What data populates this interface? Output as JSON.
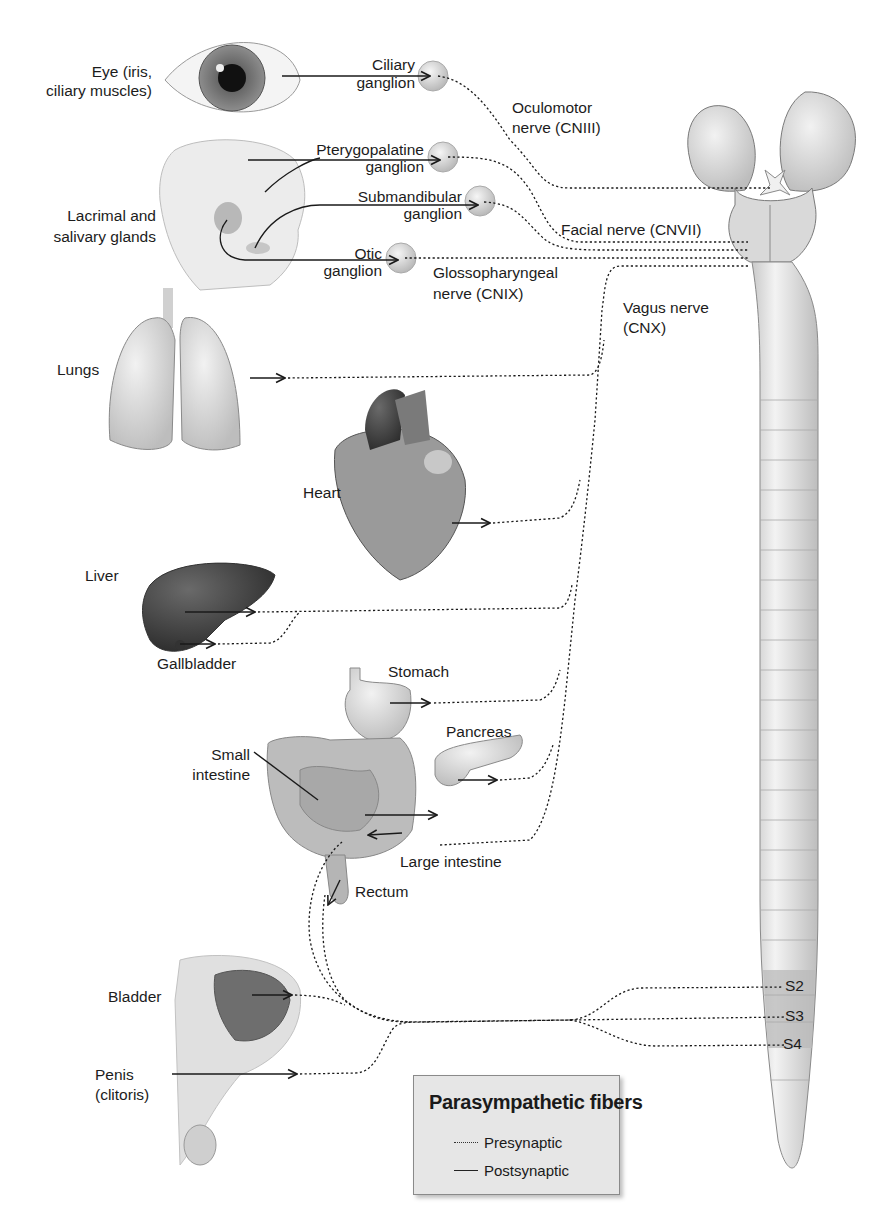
{
  "diagram": {
    "colors": {
      "nerve": "#1a1a1a",
      "ganglion": "#d6d6d6",
      "sacral_band": "#b8b8b8",
      "cord": "#e4e4e4",
      "legend_bg": "#e6e6e6"
    }
  },
  "organs": {
    "eye": "Eye (iris,\nciliary muscles)",
    "glands": "Lacrimal and\nsalivary glands",
    "lungs": "Lungs",
    "heart": "Heart",
    "liver": "Liver",
    "gallbladder": "Gallbladder",
    "stomach": "Stomach",
    "pancreas": "Pancreas",
    "small_intestine": "Small\nintestine",
    "large_intestine": "Large intestine",
    "rectum": "Rectum",
    "bladder": "Bladder",
    "penis": "Penis\n(clitoris)"
  },
  "ganglia": {
    "ciliary": "Ciliary\nganglion",
    "pterygopalatine": "Pterygopalatine\nganglion",
    "submandibular": "Submandibular\nganglion",
    "otic": "Otic\nganglion"
  },
  "nerves": {
    "oculomotor": "Oculomotor\nnerve (CNIII)",
    "facial": "Facial nerve (CNVII)",
    "glossopharyngeal": "Glossopharyngeal\nnerve (CNIX)",
    "vagus": "Vagus nerve\n(CNX)"
  },
  "spinal_segments": [
    "S2",
    "S3",
    "S4"
  ],
  "legend": {
    "title": "Parasympathetic fibers",
    "items": [
      {
        "style": "dotted",
        "label": "Presynaptic"
      },
      {
        "style": "solid",
        "label": "Postsynaptic"
      }
    ]
  }
}
